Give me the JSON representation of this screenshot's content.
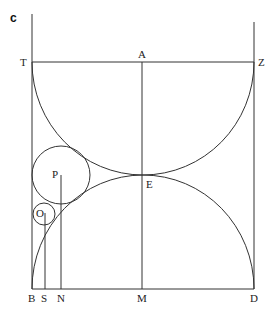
{
  "figure": {
    "panel_label": "c",
    "labels": {
      "T": "T",
      "A": "A",
      "Z": "Z",
      "E": "E",
      "P": "P",
      "O": "O",
      "B": "B",
      "S": "S",
      "N": "N",
      "M": "M",
      "D": "D"
    },
    "stroke_color": "#333333",
    "background": "#ffffff"
  }
}
